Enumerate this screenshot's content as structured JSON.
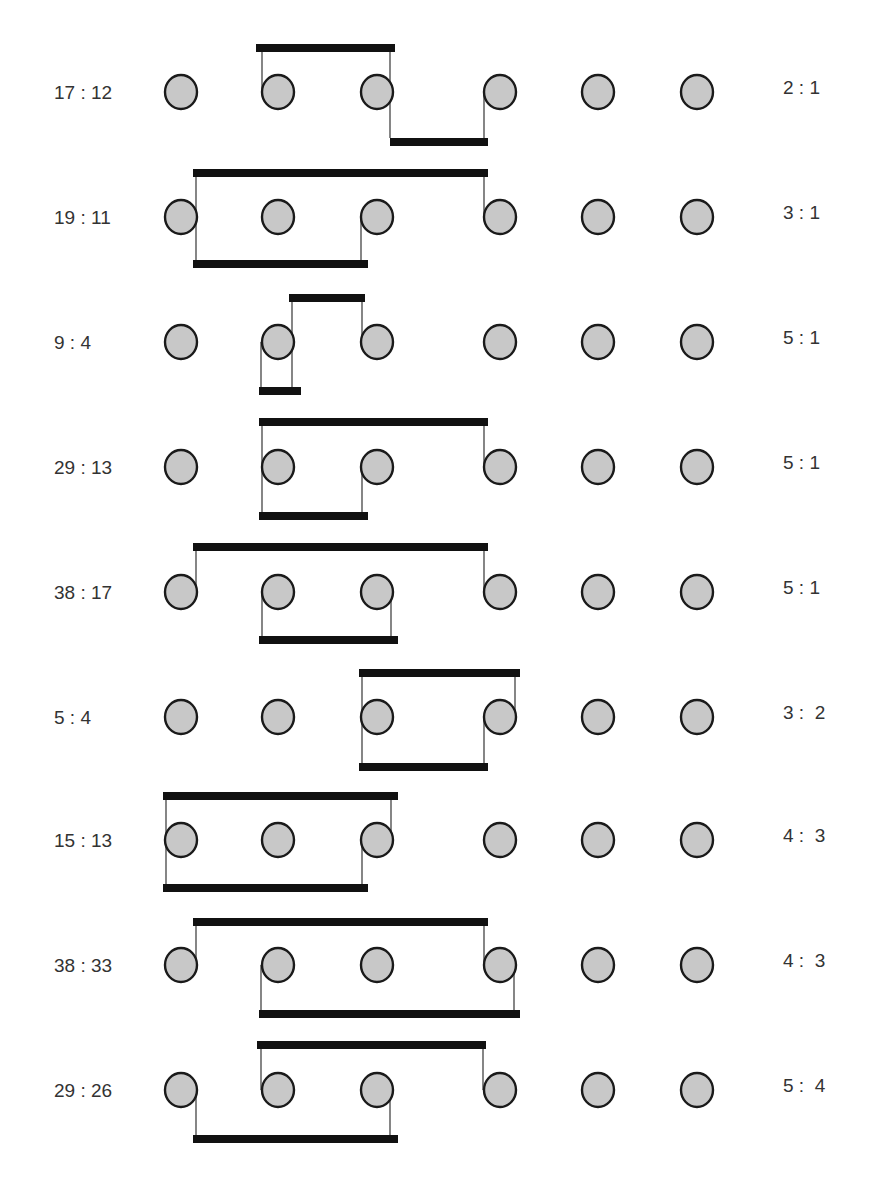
{
  "colors": {
    "circle_fill": "#c8c8c8",
    "circle_stroke": "#1a1a1a",
    "bar": "#111111",
    "line": "#222222",
    "text": "#333333",
    "background": "#ffffff"
  },
  "layout": {
    "circle_x": [
      181,
      278,
      377,
      500,
      598,
      697
    ],
    "circle_rx": 16,
    "circle_ry": 17,
    "left_label_x": 54,
    "right_label_x": 783,
    "bar_height": 8
  },
  "rows": [
    {
      "left_label": "17 : 12",
      "right_label": "2 : 1",
      "cy": 92,
      "bars": [
        {
          "x1": 256,
          "x2": 395,
          "y": 44
        },
        {
          "x1": 390,
          "x2": 488,
          "y": 138
        }
      ],
      "lines": [
        {
          "x": 262,
          "y1": 52,
          "y2": 92
        },
        {
          "x": 390,
          "y1": 52,
          "y2": 138
        },
        {
          "x": 484,
          "y1": 92,
          "y2": 138
        }
      ]
    },
    {
      "left_label": "19 : 11",
      "right_label": "3 : 1",
      "cy": 217,
      "bars": [
        {
          "x1": 193,
          "x2": 488,
          "y": 169
        },
        {
          "x1": 193,
          "x2": 368,
          "y": 260
        }
      ],
      "lines": [
        {
          "x": 196,
          "y1": 177,
          "y2": 260
        },
        {
          "x": 484,
          "y1": 177,
          "y2": 217
        },
        {
          "x": 361,
          "y1": 217,
          "y2": 260
        }
      ]
    },
    {
      "left_label": "9 : 4",
      "right_label": "5 : 1",
      "cy": 342,
      "bars": [
        {
          "x1": 289,
          "x2": 365,
          "y": 294
        },
        {
          "x1": 259,
          "x2": 301,
          "y": 387
        }
      ],
      "lines": [
        {
          "x": 292,
          "y1": 302,
          "y2": 387
        },
        {
          "x": 362,
          "y1": 302,
          "y2": 342
        },
        {
          "x": 261,
          "y1": 342,
          "y2": 387
        }
      ]
    },
    {
      "left_label": "29 : 13",
      "right_label": "5 : 1",
      "cy": 467,
      "bars": [
        {
          "x1": 259,
          "x2": 488,
          "y": 418
        },
        {
          "x1": 259,
          "x2": 368,
          "y": 512
        }
      ],
      "lines": [
        {
          "x": 262,
          "y1": 426,
          "y2": 512
        },
        {
          "x": 484,
          "y1": 426,
          "y2": 467
        },
        {
          "x": 362,
          "y1": 467,
          "y2": 512
        }
      ]
    },
    {
      "left_label": "38 : 17",
      "right_label": "5 : 1",
      "cy": 592,
      "bars": [
        {
          "x1": 193,
          "x2": 488,
          "y": 543
        },
        {
          "x1": 259,
          "x2": 398,
          "y": 636
        }
      ],
      "lines": [
        {
          "x": 196,
          "y1": 551,
          "y2": 592
        },
        {
          "x": 484,
          "y1": 551,
          "y2": 592
        },
        {
          "x": 262,
          "y1": 592,
          "y2": 636
        },
        {
          "x": 391,
          "y1": 592,
          "y2": 636
        }
      ]
    },
    {
      "left_label": "5 : 4",
      "right_label": "3 :  2",
      "cy": 717,
      "bars": [
        {
          "x1": 359,
          "x2": 520,
          "y": 669
        },
        {
          "x1": 359,
          "x2": 488,
          "y": 763
        }
      ],
      "lines": [
        {
          "x": 362,
          "y1": 677,
          "y2": 763
        },
        {
          "x": 515,
          "y1": 677,
          "y2": 717
        },
        {
          "x": 484,
          "y1": 717,
          "y2": 763
        }
      ]
    },
    {
      "left_label": "15 : 13",
      "right_label": "4 :  3",
      "cy": 840,
      "bars": [
        {
          "x1": 163,
          "x2": 398,
          "y": 792
        },
        {
          "x1": 163,
          "x2": 368,
          "y": 884
        }
      ],
      "lines": [
        {
          "x": 166,
          "y1": 800,
          "y2": 884
        },
        {
          "x": 391,
          "y1": 800,
          "y2": 840
        },
        {
          "x": 362,
          "y1": 840,
          "y2": 884
        }
      ]
    },
    {
      "left_label": "38 : 33",
      "right_label": "4 :  3",
      "cy": 965,
      "bars": [
        {
          "x1": 193,
          "x2": 488,
          "y": 918
        },
        {
          "x1": 259,
          "x2": 520,
          "y": 1010
        }
      ],
      "lines": [
        {
          "x": 196,
          "y1": 926,
          "y2": 965
        },
        {
          "x": 484,
          "y1": 926,
          "y2": 965
        },
        {
          "x": 261,
          "y1": 965,
          "y2": 1010
        },
        {
          "x": 514,
          "y1": 965,
          "y2": 1010
        }
      ]
    },
    {
      "left_label": "29 : 26",
      "right_label": "5 :  4",
      "cy": 1090,
      "bars": [
        {
          "x1": 257,
          "x2": 486,
          "y": 1041
        },
        {
          "x1": 193,
          "x2": 398,
          "y": 1135
        }
      ],
      "lines": [
        {
          "x": 261,
          "y1": 1049,
          "y2": 1090
        },
        {
          "x": 483,
          "y1": 1049,
          "y2": 1090
        },
        {
          "x": 196,
          "y1": 1090,
          "y2": 1135
        },
        {
          "x": 390,
          "y1": 1090,
          "y2": 1135
        }
      ]
    }
  ]
}
